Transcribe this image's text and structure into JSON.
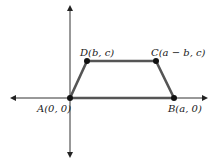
{
  "diagram": {
    "colors": {
      "axis": "#333333",
      "edge": "#555555",
      "vertex": "#111111",
      "text": "#1a1a1a"
    },
    "axes": {
      "origin_px": [
        70,
        98
      ],
      "x_axis": {
        "from_px": 10,
        "to_px": 208,
        "arrows": "both"
      },
      "y_axis": {
        "from_px": 5,
        "to_px": 158,
        "arrows": "both"
      }
    },
    "vertices": [
      {
        "id": "A",
        "label": "A(0, 0)",
        "px": [
          70,
          98
        ],
        "label_px": [
          37,
          104
        ]
      },
      {
        "id": "B",
        "label": "B(a, 0)",
        "px": [
          174,
          98
        ],
        "label_px": [
          168,
          104
        ]
      },
      {
        "id": "C",
        "label": "C(a − b, c)",
        "px": [
          156,
          61
        ],
        "label_px": [
          151,
          48
        ]
      },
      {
        "id": "D",
        "label": "D(b, c)",
        "px": [
          87,
          61
        ],
        "label_px": [
          80,
          48
        ]
      }
    ],
    "edges": [
      [
        "A",
        "B"
      ],
      [
        "B",
        "C"
      ],
      [
        "C",
        "D"
      ],
      [
        "D",
        "A"
      ]
    ]
  }
}
